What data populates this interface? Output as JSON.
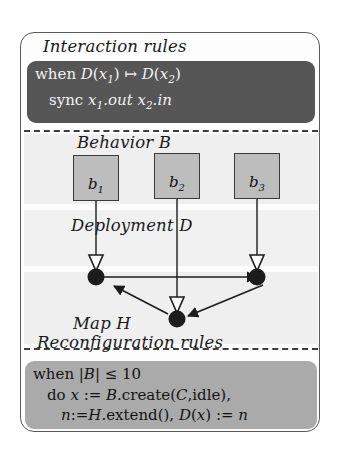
{
  "figure": {
    "sections": {
      "interaction": {
        "caption": "Interaction rules",
        "box_color": "#565656",
        "text_color": "#f2f2f2",
        "lines": [
          {
            "id": "when-mapsto",
            "plain": "when D(x1) ↦ D(x2)"
          },
          {
            "id": "sync-out-in",
            "plain": "sync x1.out x2.in"
          }
        ]
      },
      "behavior": {
        "caption": "Behavior B",
        "band_color": "#efefef",
        "boxes": [
          {
            "id": "b1",
            "base": "b",
            "sub": "1"
          },
          {
            "id": "b2",
            "base": "b",
            "sub": "2"
          },
          {
            "id": "b3",
            "base": "b",
            "sub": "3"
          }
        ],
        "box_fill": "#bdbdbd",
        "box_stroke": "#3a3a3a"
      },
      "deployment": {
        "caption": "Deployment D",
        "band_color": "#f1f1f1"
      },
      "map": {
        "caption": "Map H",
        "band_color": "#efefef",
        "node_fill": "#1c1c1c",
        "nodes": [
          {
            "id": "node-left",
            "cx": 96,
            "cy": 244
          },
          {
            "id": "node-right",
            "cx": 247,
            "cy": 244
          },
          {
            "id": "node-bottom",
            "cx": 156,
            "cy": 286
          }
        ],
        "edges": [
          {
            "id": "edge-left-to-right",
            "from": "node-left",
            "to": "node-right",
            "arrow": "filled"
          },
          {
            "id": "edge-right-to-bottom",
            "from": "node-right",
            "to": "node-bottom",
            "arrow": "filled"
          },
          {
            "id": "edge-bottom-to-left",
            "from": "node-bottom",
            "to": "node-left",
            "arrow": "filled"
          }
        ],
        "deployment_links": [
          {
            "id": "link-b1",
            "from_box": "b1",
            "to_node": "node-left",
            "arrow": "hollow-triangle"
          },
          {
            "id": "link-b2",
            "from_box": "b2",
            "to_node": "node-bottom",
            "arrow": "hollow-triangle"
          },
          {
            "id": "link-b3",
            "from_box": "b3",
            "to_node": "node-right",
            "arrow": "hollow-triangle"
          }
        ]
      },
      "reconfiguration": {
        "caption": "Reconfiguration rules",
        "box_color": "#aaaaaa",
        "text_color": "#141414",
        "lines": [
          {
            "id": "when-card-le",
            "plain": "when |B| ≤ 10"
          },
          {
            "id": "do-create",
            "plain": "do x := B.create(C,idle),"
          },
          {
            "id": "n-extend-assign",
            "plain": "n:=H.extend(), D(x) := n"
          }
        ]
      }
    },
    "frame": {
      "border_color": "#5a5a5a",
      "background": "#fdfdfd"
    },
    "separators": {
      "color": "#3d3d3d",
      "style": "dashed"
    }
  }
}
